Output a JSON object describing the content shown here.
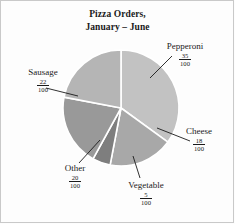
{
  "chart_data": {
    "type": "pie",
    "title": "Pizza Orders, January – June",
    "title_line1": "Pizza Orders,",
    "title_line2": "January – June",
    "denominator": 100,
    "categories": [
      "Pepperoni",
      "Sausage",
      "Other",
      "Cheese",
      "Vegetable"
    ],
    "values": [
      35,
      22,
      20,
      18,
      5
    ],
    "value_format": "fraction-out-of-100",
    "legend": "none",
    "labels_position": "outside-with-leader-lines",
    "slices": [
      {
        "name": "Pepperoni",
        "numerator": "35",
        "denominator": "100",
        "value": 35,
        "color": "#c2c2c2",
        "start_angle": 0,
        "sweep_angle": 126
      },
      {
        "name": "Cheese",
        "numerator": "18",
        "denominator": "100",
        "value": 18,
        "color": "#a8a8a8",
        "start_angle": 126,
        "sweep_angle": 64.8
      },
      {
        "name": "Vegetable",
        "numerator": "5",
        "denominator": "100",
        "value": 5,
        "color": "#7e7e7e",
        "start_angle": 190.8,
        "sweep_angle": 18
      },
      {
        "name": "Other",
        "numerator": "20",
        "denominator": "100",
        "value": 20,
        "color": "#999999",
        "start_angle": 208.8,
        "sweep_angle": 72
      },
      {
        "name": "Sausage",
        "numerator": "22",
        "denominator": "100",
        "value": 22,
        "color": "#b5b5b5",
        "start_angle": 280.8,
        "sweep_angle": 79.2
      }
    ],
    "colors": {
      "pepperoni": "#c2c2c2",
      "sausage": "#b5b5b5",
      "cheese": "#a8a8a8",
      "other": "#999999",
      "vegetable": "#7e7e7e",
      "slice_divider": "#ffffff",
      "text": "#1a1a1a",
      "background": "#fdfdfd",
      "frame": "#c9c9c9"
    },
    "geometry": {
      "center_x": 121,
      "center_y": 108,
      "radius": 59
    }
  }
}
